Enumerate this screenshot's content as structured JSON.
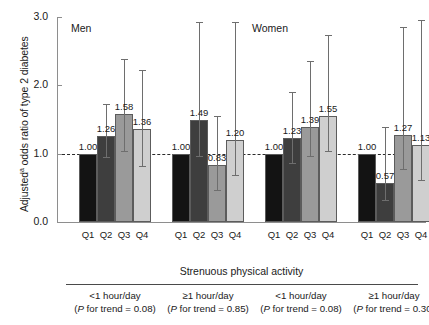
{
  "chart_data": {
    "type": "bar",
    "title": "",
    "xlabel": "Strenuous physical activity",
    "ylabel": "Adjusted odds ratio of type 2 diabetes",
    "ylabel_superscript": "a",
    "ylim": [
      0.0,
      3.0
    ],
    "yticks": [
      "0.0",
      "1.0",
      "2.0",
      "3.0"
    ],
    "ytick_values": [
      0.0,
      1.0,
      2.0,
      3.0
    ],
    "reference_line": 1.0,
    "grid": false,
    "legend": "none",
    "panels": [
      "Men",
      "Women"
    ],
    "categories": [
      "Q1",
      "Q2",
      "Q3",
      "Q4"
    ],
    "groups": [
      {
        "panel": "Men",
        "label": "<1 hour/day",
        "p_label": "(P for trend = 0.08)",
        "p_value": 0.08,
        "values": [
          1.0,
          1.26,
          1.58,
          1.36
        ],
        "ci_low": [
          null,
          0.95,
          1.04,
          0.82
        ],
        "ci_high": [
          null,
          1.72,
          2.38,
          2.22
        ]
      },
      {
        "panel": "Men",
        "label": "≥1 hour/day",
        "p_label": "(P for trend = 0.85)",
        "p_value": 0.85,
        "values": [
          1.0,
          1.49,
          0.83,
          1.2
        ],
        "ci_low": [
          null,
          0.96,
          0.47,
          0.69
        ],
        "ci_high": [
          null,
          2.92,
          1.55,
          2.93
        ]
      },
      {
        "panel": "Women",
        "label": "<1 hour/day",
        "p_label": "(P for trend = 0.08)",
        "p_value": 0.08,
        "values": [
          1.0,
          1.23,
          1.39,
          1.55
        ],
        "ci_low": [
          null,
          0.87,
          0.97,
          1.04
        ],
        "ci_high": [
          null,
          1.9,
          2.35,
          2.73
        ]
      },
      {
        "panel": "Women",
        "label": "≥1 hour/day",
        "p_label": "(P for trend = 0.30)",
        "p_value": 0.3,
        "values": [
          1.0,
          0.57,
          1.27,
          1.13
        ],
        "ci_low": [
          null,
          0.32,
          0.77,
          0.62
        ],
        "ci_high": [
          null,
          1.39,
          2.86,
          2.96
        ]
      }
    ],
    "bar_colors": [
      "#131313",
      "#3e3e3e",
      "#9a9a9a",
      "#cfcfcf"
    ],
    "bar_color_names": [
      "Q1-black",
      "Q2-dark-gray",
      "Q3-medium-gray",
      "Q4-light-gray"
    ],
    "value_labels": [
      [
        "1.00",
        "1.26",
        "1.58",
        "1.36"
      ],
      [
        "1.00",
        "1.49",
        "0.83",
        "1.20"
      ],
      [
        "1.00",
        "1.23",
        "1.39",
        "1.55"
      ],
      [
        "1.00",
        "0.57",
        "1.27",
        "1.13"
      ]
    ]
  },
  "panel_titles": {
    "men": "Men",
    "women": "Women"
  }
}
